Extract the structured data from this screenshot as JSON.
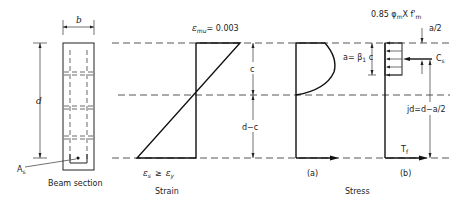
{
  "beam_section": {
    "width_label": "b",
    "depth_label": "d",
    "steel_label": "A",
    "steel_sub": "s",
    "caption": "Beam section"
  },
  "strain": {
    "top_label": "ε",
    "top_sub": "mu",
    "top_value": "= 0.003",
    "c_label": "c",
    "dc_label": "d−c",
    "bottom_eps_s": "ε",
    "bottom_eps_s_sub": "s",
    "bottom_ge": "≥",
    "bottom_eps_y": "ε",
    "bottom_eps_y_sub": "y",
    "caption": "Strain"
  },
  "stress": {
    "a_label": "a= β",
    "a_sub": "1",
    "a_tail": " c",
    "block_label": "0.85 φ",
    "block_sub1": "m",
    "block_mid": "X f'",
    "block_sub2": "m",
    "half_a_label": "a/2",
    "cs_label": "C",
    "cs_sub": "s",
    "jd_label": "jd=d−a/2",
    "tf_label": "T",
    "tf_sub": "f",
    "panel_a": "(a)",
    "panel_b": "(b)",
    "caption": "Stress"
  }
}
